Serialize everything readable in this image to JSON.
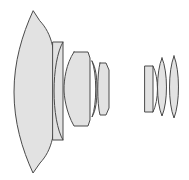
{
  "diagram": {
    "background_color": "#ffffff",
    "glass_fill_color": "#e2e2e2",
    "glass_outline_color": "#4a4a4a",
    "outline_width": 1,
    "canvas": {
      "width": 189,
      "height": 180
    },
    "group_count": 2,
    "element_count": 8
  },
  "groups": [
    {
      "id": "front-group",
      "label": "Front group",
      "element_count": 5,
      "elements": [
        {
          "id": "element-1",
          "label": "Element 1",
          "type": "negative-meniscus",
          "description": "Large deeply concave negative meniscus, convex front surface",
          "path": "M 33 11 C 22 35 14 62 14 92 C 14 122 22 149 33 173 L 40 163 C 52 150 56 134 56 92 C 56 50 52 34 40 21 Z",
          "fill": "#e2e2e2",
          "stroke": "#4a4a4a"
        },
        {
          "id": "element-2",
          "label": "Element 2",
          "type": "plano-concave-block",
          "description": "Thin tall rectangular plate with concave left surface",
          "path": "M 53 42 L 63 42 L 63 140 L 53 140 Z",
          "fill": "#e2e2e2",
          "stroke": "#4a4a4a"
        },
        {
          "id": "element-2-inner-arc",
          "label": "Element 2 inner surface",
          "type": "surface-arc",
          "description": "Concave surface arc inside plate",
          "path": "M 63 42 C 51 62 51 120 63 140",
          "fill": "none",
          "stroke": "#4a4a4a"
        },
        {
          "id": "element-3",
          "label": "Element 3",
          "type": "thick-positive",
          "description": "Thick positive element with chamfered corners",
          "path": "M 74 52 L 88 52 L 90 58 L 90 120 L 88 126 L 74 126 C 66 112 64 96 64 89 C 64 80 66 64 74 52 Z",
          "fill": "#e2e2e2",
          "stroke": "#4a4a4a"
        },
        {
          "id": "element-4",
          "label": "Element 4",
          "type": "thin-meniscus",
          "description": "Thin crescent meniscus element",
          "path": "M 92 61 C 97 73 97 105 92 117 C 96 110 97 100 97 89 C 97 78 96 68 92 61 Z",
          "fill": "#e2e2e2",
          "stroke": "#4a4a4a"
        },
        {
          "id": "element-5",
          "label": "Element 5",
          "type": "positive-meniscus",
          "description": "Small positive meniscus element",
          "path": "M 100 63 L 106 63 L 109 70 L 109 108 L 106 115 L 100 115 C 97 104 97 74 100 63 Z",
          "fill": "#e2e2e2",
          "stroke": "#4a4a4a"
        }
      ]
    },
    {
      "id": "rear-group",
      "label": "Rear group",
      "element_count": 3,
      "elements": [
        {
          "id": "element-6",
          "label": "Element 6",
          "type": "plano-convex-block",
          "description": "Rectangular element with convex right surface",
          "path": "M 145 66 L 153 66 L 153 112 L 145 112 Z",
          "fill": "#e2e2e2",
          "stroke": "#4a4a4a"
        },
        {
          "id": "element-6-inner-arc",
          "label": "Element 6 inner surface",
          "type": "surface-arc",
          "description": "Convex surface arc inside plate",
          "path": "M 153 66 C 159 78 159 100 153 112",
          "fill": "none",
          "stroke": "#4a4a4a"
        },
        {
          "id": "element-7",
          "label": "Element 7",
          "type": "biconvex",
          "description": "Biconvex element",
          "path": "M 162 58 C 168 72 168 102 162 116 C 156 102 156 72 162 58 Z",
          "fill": "#e2e2e2",
          "stroke": "#4a4a4a"
        },
        {
          "id": "element-8",
          "label": "Element 8",
          "type": "biconvex",
          "description": "Biconvex element, rearmost",
          "path": "M 174 56 C 180 71 180 103 174 118 C 168 103 168 71 174 56 Z",
          "fill": "#e2e2e2",
          "stroke": "#4a4a4a"
        }
      ]
    }
  ]
}
